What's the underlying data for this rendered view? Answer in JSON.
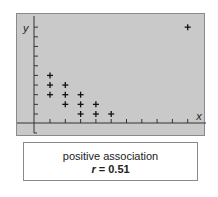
{
  "chart_data": {
    "type": "scatter",
    "title": "",
    "xlabel": "x",
    "ylabel": "y",
    "xlim": [
      0,
      10.5
    ],
    "ylim": [
      0,
      11
    ],
    "grid": false,
    "x_ticks": 10,
    "y_ticks": 10,
    "marker": "+",
    "points": [
      {
        "x": 1,
        "y": 5
      },
      {
        "x": 1,
        "y": 4
      },
      {
        "x": 1,
        "y": 3
      },
      {
        "x": 2,
        "y": 4
      },
      {
        "x": 2,
        "y": 3
      },
      {
        "x": 2,
        "y": 2
      },
      {
        "x": 3,
        "y": 3
      },
      {
        "x": 3,
        "y": 2
      },
      {
        "x": 3,
        "y": 1
      },
      {
        "x": 4,
        "y": 2
      },
      {
        "x": 4,
        "y": 1
      },
      {
        "x": 5,
        "y": 1
      },
      {
        "x": 10,
        "y": 10
      }
    ],
    "annotation": {
      "line1": "positive association",
      "line2_var": "r",
      "line2_eq": " = ",
      "line2_value": "0.51"
    }
  },
  "colors": {
    "panel_bg": "#c9c9c9",
    "axis": "#333333",
    "marker": "#111111",
    "border": "#8a8a8a"
  }
}
